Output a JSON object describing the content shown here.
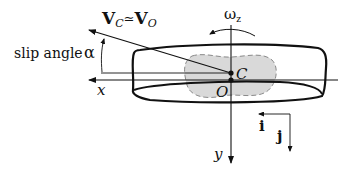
{
  "diagram": {
    "labels": {
      "velocity_main": "V",
      "velocity_sub_c": "C",
      "approx": "≃",
      "velocity_main_2": "V",
      "velocity_sub_o": "O",
      "slip_angle_text": "slip angle",
      "alpha": "α",
      "omega": "ω",
      "omega_sub": "z",
      "point_c": "C",
      "point_o": "O",
      "x_axis": "x",
      "y_axis": "y",
      "unit_i": "i",
      "unit_j": "j"
    },
    "colors": {
      "stroke": "#111111",
      "contact_patch": "#d9d9d9",
      "contact_patch_edge": "#8a8a8a"
    }
  }
}
